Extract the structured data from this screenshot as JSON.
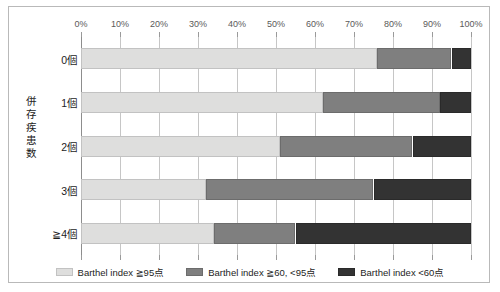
{
  "chart_data": {
    "type": "bar",
    "orientation": "horizontal",
    "stacked": true,
    "normalized": "100%",
    "title": "",
    "xlabel": "",
    "ylabel": "併存疾患数",
    "categories": [
      "0個",
      "1個",
      "2個",
      "3個",
      "≧4個"
    ],
    "series": [
      {
        "name": "Barthel index ≧95点",
        "color": "#dededd",
        "values": [
          76,
          62,
          51,
          32,
          34
        ]
      },
      {
        "name": "Barthel index ≧60, <95点",
        "color": "#7f7f7f",
        "values": [
          19,
          30,
          34,
          43,
          21
        ]
      },
      {
        "name": "Barthel index <60点",
        "color": "#333333",
        "values": [
          5,
          8,
          15,
          25,
          45
        ]
      }
    ],
    "xlim": [
      0,
      100
    ],
    "xticks": [
      0,
      10,
      20,
      30,
      40,
      50,
      60,
      70,
      80,
      90,
      100
    ],
    "xtick_labels": [
      "0%",
      "10%",
      "20%",
      "30%",
      "40%",
      "50%",
      "60%",
      "70%",
      "80%",
      "90%",
      "100%"
    ],
    "grid": true,
    "legend_position": "bottom"
  },
  "axis": {
    "y_title_chars": [
      "併",
      "存",
      "疾",
      "患",
      "数"
    ]
  },
  "legend": {
    "items": [
      {
        "label": "Barthel index ≧95点",
        "swatch": "legend-swatch-light"
      },
      {
        "label": "Barthel index ≧60, <95点",
        "swatch": "legend-swatch-mid"
      },
      {
        "label": "Barthel index <60点",
        "swatch": "legend-swatch-dark"
      }
    ]
  }
}
